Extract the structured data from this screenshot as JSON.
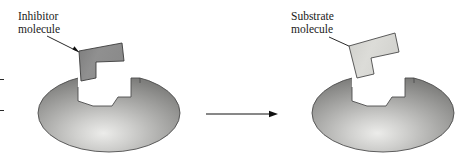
{
  "figure": {
    "background_color": "#ffffff",
    "width": 470,
    "height": 157
  },
  "colors": {
    "inhibitor_fill": "#8c8c8c",
    "inhibitor_stroke": "#3a3a3a",
    "substrate_fill": "#d6d6d2",
    "substrate_stroke": "#4a4a4a",
    "enzyme_light": "#e6e6e4",
    "enzyme_mid": "#a9a9a7",
    "enzyme_dark": "#7b7b7b",
    "enzyme_stroke": "#4d4d4d",
    "text": "#1a1a1a",
    "arrow": "#111111"
  },
  "panels": [
    {
      "id": "inhibitor-panel",
      "label": {
        "line1": "Inhibitor",
        "line2": "molecule"
      },
      "molecule_name": "inhibitor-molecule",
      "enzyme_name": "enzyme-body-left"
    },
    {
      "id": "substrate-panel",
      "label": {
        "line1": "Substrate",
        "line2": "molecule"
      },
      "molecule_name": "substrate-molecule",
      "enzyme_name": "enzyme-body-right"
    }
  ],
  "reaction_arrow": {
    "name": "reaction-arrow",
    "direction": "right",
    "label": ""
  }
}
